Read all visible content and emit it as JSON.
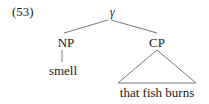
{
  "example": {
    "number": "(53)",
    "tree": {
      "root": "γ",
      "left": {
        "label": "NP",
        "child": "smell"
      },
      "right": {
        "label": "CP",
        "triangle_yield": "that fish burns"
      }
    }
  },
  "colors": {
    "text": "#222222",
    "lines": "#555555",
    "background": "#ffffff"
  }
}
